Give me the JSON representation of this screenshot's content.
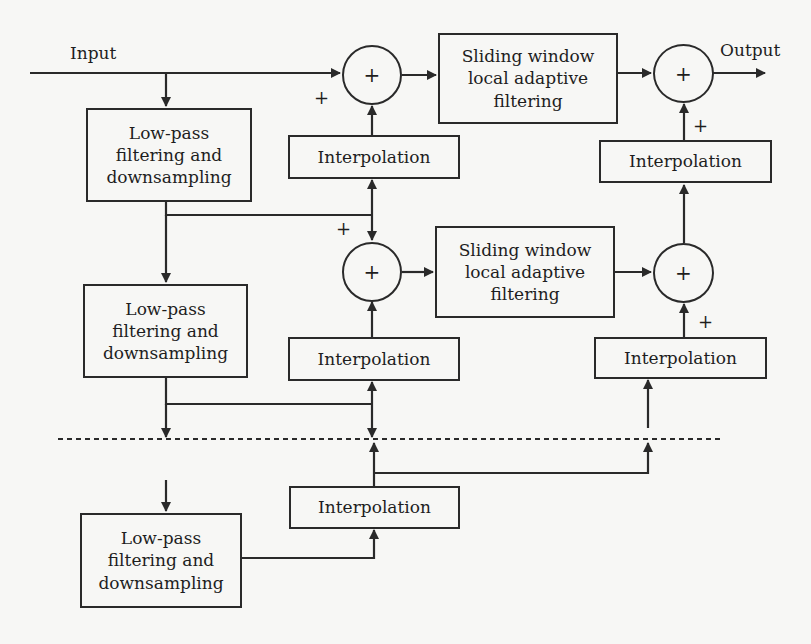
{
  "diagram": {
    "io": {
      "input_label": "Input",
      "output_label": "Output"
    },
    "lowpass_blocks": [
      {
        "label": "Low-pass\nfiltering and\ndownsampling"
      },
      {
        "label": "Low-pass\nfiltering and\ndownsampling"
      },
      {
        "label": "Low-pass\nfiltering and\ndownsampling"
      }
    ],
    "interpolation_blocks": [
      {
        "label": "Interpolation"
      },
      {
        "label": "Interpolation"
      },
      {
        "label": "Interpolation"
      },
      {
        "label": "Interpolation"
      },
      {
        "label": "Interpolation"
      }
    ],
    "filter_blocks": [
      {
        "label": "Sliding window\nlocal adaptive\nfiltering"
      },
      {
        "label": "Sliding window\nlocal adaptive\nfiltering"
      }
    ],
    "adders": [
      {
        "symbol": "+"
      },
      {
        "symbol": "+"
      },
      {
        "symbol": "+"
      },
      {
        "symbol": "+"
      }
    ],
    "signs": [
      {
        "symbol": "+"
      },
      {
        "symbol": "+"
      },
      {
        "symbol": "+"
      },
      {
        "symbol": "+"
      }
    ],
    "colors": {
      "line": "#2a2a2a",
      "background": "#f7f7f5"
    }
  }
}
